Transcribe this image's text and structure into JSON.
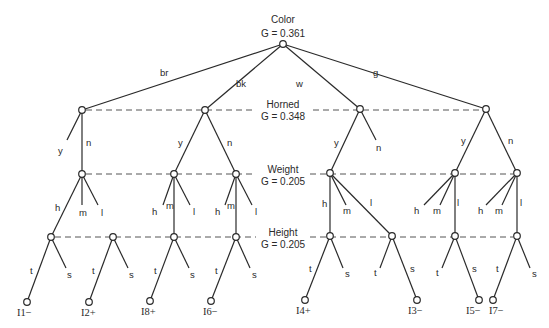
{
  "diagram": {
    "levels": [
      {
        "id": "color",
        "attribute": "Color",
        "gain": "G = 0.361",
        "y": 44
      },
      {
        "id": "horned",
        "attribute": "Horned",
        "gain": "G = 0.348",
        "y": 110
      },
      {
        "id": "weight",
        "attribute": "Weight",
        "gain": "G = 0.205",
        "y": 174
      },
      {
        "id": "height",
        "attribute": "Height",
        "gain": "G = 0.205",
        "y": 237
      }
    ],
    "nodes": [
      {
        "id": "root",
        "x": 283,
        "y": 44
      },
      {
        "id": "br",
        "x": 82,
        "y": 110
      },
      {
        "id": "bk",
        "x": 205,
        "y": 110
      },
      {
        "id": "w",
        "x": 360,
        "y": 109
      },
      {
        "id": "g",
        "x": 486,
        "y": 109
      },
      {
        "id": "br_n",
        "x": 82,
        "y": 174
      },
      {
        "id": "bk_y",
        "x": 174,
        "y": 174
      },
      {
        "id": "bk_n",
        "x": 236,
        "y": 174
      },
      {
        "id": "w_y",
        "x": 330,
        "y": 173
      },
      {
        "id": "g_y",
        "x": 455,
        "y": 173
      },
      {
        "id": "g_n",
        "x": 517,
        "y": 173
      },
      {
        "id": "br_n_h",
        "x": 51,
        "y": 237
      },
      {
        "id": "br_extra",
        "x": 113,
        "y": 237
      },
      {
        "id": "bk_y_m",
        "x": 174,
        "y": 237
      },
      {
        "id": "bk_n_m",
        "x": 236,
        "y": 237
      },
      {
        "id": "w_y_h",
        "x": 330,
        "y": 236
      },
      {
        "id": "w_y_l",
        "x": 392,
        "y": 236
      },
      {
        "id": "g_y_l",
        "x": 455,
        "y": 236
      },
      {
        "id": "g_n_l",
        "x": 517,
        "y": 236
      },
      {
        "id": "I1",
        "x": 27,
        "y": 302
      },
      {
        "id": "I2",
        "x": 89,
        "y": 302
      },
      {
        "id": "I8",
        "x": 150,
        "y": 301
      },
      {
        "id": "I6",
        "x": 211,
        "y": 301
      },
      {
        "id": "I4",
        "x": 305,
        "y": 300
      },
      {
        "id": "I3",
        "x": 417,
        "y": 300
      },
      {
        "id": "I5",
        "x": 479,
        "y": 300
      },
      {
        "id": "I7",
        "x": 493,
        "y": 300
      }
    ],
    "edges": [
      {
        "from": "root",
        "to": "br",
        "label": "br",
        "lx": 160,
        "ly": 76
      },
      {
        "from": "root",
        "to": "bk",
        "label": "bk",
        "lx": 236,
        "ly": 87
      },
      {
        "from": "root",
        "to": "w",
        "label": "w",
        "lx": 296,
        "ly": 87
      },
      {
        "from": "root",
        "to": "g",
        "label": "g",
        "lx": 373,
        "ly": 76
      },
      {
        "from": "br",
        "to": "br_n",
        "label": "n",
        "lx": 86,
        "ly": 146
      },
      {
        "from": "br",
        "to": "@67,140",
        "label": "y",
        "lx": 58,
        "ly": 154
      },
      {
        "from": "bk",
        "to": "bk_y",
        "label": "y",
        "lx": 178,
        "ly": 146
      },
      {
        "from": "bk",
        "to": "bk_n",
        "label": "n",
        "lx": 227,
        "ly": 146
      },
      {
        "from": "w",
        "to": "w_y",
        "label": "y",
        "lx": 334,
        "ly": 146
      },
      {
        "from": "w",
        "to": "@376,140",
        "label": "n",
        "lx": 376,
        "ly": 151
      },
      {
        "from": "g",
        "to": "g_y",
        "label": "y",
        "lx": 461,
        "ly": 144
      },
      {
        "from": "g",
        "to": "g_n",
        "label": "n",
        "lx": 508,
        "ly": 144
      },
      {
        "from": "br_n",
        "to": "br_n_h",
        "label": "h",
        "lx": 55,
        "ly": 211
      },
      {
        "from": "br_n",
        "to": "@82,205",
        "label": "m",
        "lx": 79,
        "ly": 216
      },
      {
        "from": "br_n",
        "to": "@98,205",
        "label": "l",
        "lx": 101,
        "ly": 216
      },
      {
        "from": "bk_y",
        "to": "@163,205",
        "label": "h",
        "lx": 152,
        "ly": 215
      },
      {
        "from": "bk_y",
        "to": "bk_y_m",
        "label": "m",
        "lx": 166,
        "ly": 209
      },
      {
        "from": "bk_y",
        "to": "@190,205",
        "label": "l",
        "lx": 193,
        "ly": 215
      },
      {
        "from": "bk_n",
        "to": "@225,205",
        "label": "h",
        "lx": 215,
        "ly": 215
      },
      {
        "from": "bk_n",
        "to": "bk_n_m",
        "label": "m",
        "lx": 227,
        "ly": 209
      },
      {
        "from": "bk_n",
        "to": "@252,205",
        "label": "l",
        "lx": 255,
        "ly": 215
      },
      {
        "from": "w_y",
        "to": "w_y_h",
        "label": "h",
        "lx": 322,
        "ly": 207
      },
      {
        "from": "w_y",
        "to": "@346,205",
        "label": "m",
        "lx": 343,
        "ly": 214
      },
      {
        "from": "w_y",
        "to": "w_y_l",
        "label": "l",
        "lx": 370,
        "ly": 206
      },
      {
        "from": "g_y",
        "to": "@424,205",
        "label": "h",
        "lx": 414,
        "ly": 214
      },
      {
        "from": "g_y",
        "to": "@440,205",
        "label": "m",
        "lx": 433,
        "ly": 214
      },
      {
        "from": "g_y",
        "to": "g_y_l",
        "label": "l",
        "lx": 457,
        "ly": 206
      },
      {
        "from": "g_n",
        "to": "@486,205",
        "label": "h",
        "lx": 478,
        "ly": 214
      },
      {
        "from": "g_n",
        "to": "@502,205",
        "label": "m",
        "lx": 495,
        "ly": 214
      },
      {
        "from": "g_n",
        "to": "g_n_l",
        "label": "l",
        "lx": 520,
        "ly": 206
      },
      {
        "from": "br_n_h",
        "to": "I1",
        "label": "t",
        "lx": 30,
        "ly": 274
      },
      {
        "from": "br_n_h",
        "to": "@66,268",
        "label": "s",
        "lx": 67,
        "ly": 278
      },
      {
        "from": "br_extra",
        "to": "I2",
        "label": "t",
        "lx": 92,
        "ly": 274
      },
      {
        "from": "br_extra",
        "to": "@128,268",
        "label": "s",
        "lx": 129,
        "ly": 278
      },
      {
        "from": "bk_y_m",
        "to": "I8",
        "label": "t",
        "lx": 154,
        "ly": 274
      },
      {
        "from": "bk_y_m",
        "to": "@189,268",
        "label": "s",
        "lx": 190,
        "ly": 278
      },
      {
        "from": "bk_n_m",
        "to": "I6",
        "label": "t",
        "lx": 215,
        "ly": 274
      },
      {
        "from": "bk_n_m",
        "to": "@250,268",
        "label": "s",
        "lx": 252,
        "ly": 278
      },
      {
        "from": "w_y_h",
        "to": "I4",
        "label": "t",
        "lx": 309,
        "ly": 272
      },
      {
        "from": "w_y_h",
        "to": "@343,268",
        "label": "s",
        "lx": 345,
        "ly": 277
      },
      {
        "from": "w_y_l",
        "to": "@380,268",
        "label": "t",
        "lx": 374,
        "ly": 276
      },
      {
        "from": "w_y_l",
        "to": "I3",
        "label": "s",
        "lx": 410,
        "ly": 272
      },
      {
        "from": "g_y_l",
        "to": "@442,268",
        "label": "t",
        "lx": 436,
        "ly": 276
      },
      {
        "from": "g_y_l",
        "to": "I5",
        "label": "s",
        "lx": 472,
        "ly": 272
      },
      {
        "from": "g_n_l",
        "to": "I7",
        "label": "t",
        "lx": 496,
        "ly": 272
      },
      {
        "from": "g_n_l",
        "to": "@530,268",
        "label": "s",
        "lx": 532,
        "ly": 277
      }
    ],
    "leaves": [
      {
        "node": "I1",
        "label": "I1−",
        "lx": 17,
        "ly": 316
      },
      {
        "node": "I2",
        "label": "I2+",
        "lx": 81,
        "ly": 316
      },
      {
        "node": "I8",
        "label": "I8+",
        "lx": 141,
        "ly": 315
      },
      {
        "node": "I6",
        "label": "I6−",
        "lx": 203,
        "ly": 315
      },
      {
        "node": "I4",
        "label": "I4+",
        "lx": 296,
        "ly": 314
      },
      {
        "node": "I3",
        "label": "I3−",
        "lx": 408,
        "ly": 314
      },
      {
        "node": "I5",
        "label": "I5−",
        "lx": 466,
        "ly": 314
      },
      {
        "node": "I7",
        "label": "I7−",
        "lx": 489,
        "ly": 314
      }
    ],
    "level_separators": [
      {
        "y": 110,
        "x1": 86,
        "x2": 482,
        "gap": [
          253,
          313
        ]
      },
      {
        "y": 174,
        "x1": 86,
        "x2": 513,
        "gap": [
          256,
          310
        ]
      },
      {
        "y": 237,
        "x1": 55,
        "x2": 513,
        "gap": [
          256,
          310
        ]
      }
    ]
  }
}
